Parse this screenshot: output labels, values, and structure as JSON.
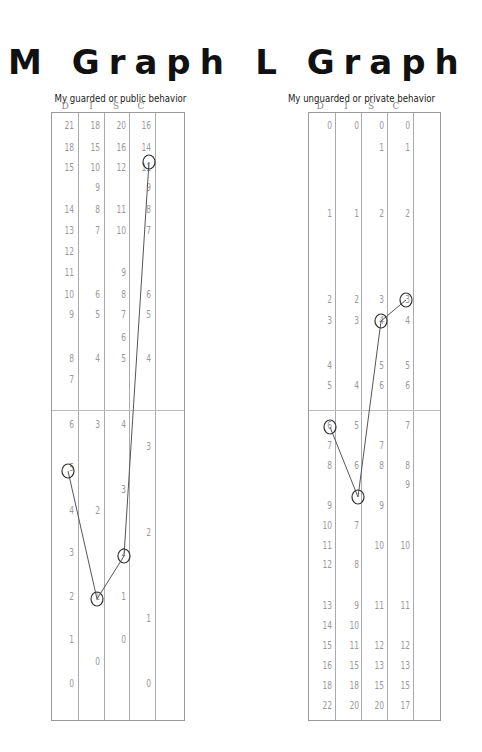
{
  "chart_data": [
    {
      "type": "line",
      "title": "M Graph",
      "subtitle": "My guarded or public behavior",
      "columns": [
        "D",
        "I",
        "S",
        "C"
      ],
      "scale_values": {
        "D": [
          21,
          18,
          15,
          14,
          13,
          12,
          11,
          10,
          9,
          8,
          7,
          6,
          5,
          4,
          3,
          2,
          1,
          0
        ],
        "I": [
          18,
          15,
          10,
          9,
          8,
          7,
          6,
          5,
          4,
          3,
          2,
          1,
          0
        ],
        "S": [
          20,
          16,
          12,
          11,
          10,
          9,
          8,
          7,
          6,
          5,
          4,
          3,
          2,
          1,
          0
        ],
        "C": [
          16,
          14,
          11,
          9,
          8,
          7,
          6,
          5,
          4,
          3,
          2,
          1,
          0
        ]
      },
      "plotted_points": {
        "D": 5,
        "I": 1,
        "S": 2,
        "C": 14
      },
      "midline": true
    },
    {
      "type": "line",
      "title": "L Graph",
      "subtitle": "My unguarded or private behavior",
      "columns": [
        "D",
        "I",
        "S",
        "C"
      ],
      "scale_values": {
        "D": [
          0,
          1,
          2,
          3,
          4,
          5,
          6,
          7,
          8,
          9,
          10,
          11,
          12,
          13,
          14,
          15,
          16,
          18,
          22
        ],
        "I": [
          0,
          1,
          2,
          3,
          4,
          5,
          6,
          7,
          8,
          9,
          10,
          11,
          15,
          18,
          20
        ],
        "S": [
          0,
          1,
          2,
          3,
          4,
          5,
          6,
          7,
          8,
          9,
          10,
          11,
          12,
          13,
          15,
          20
        ],
        "C": [
          0,
          1,
          2,
          3,
          4,
          5,
          6,
          7,
          8,
          9,
          10,
          11,
          12,
          13,
          15,
          17
        ]
      },
      "plotted_points": {
        "D": 6,
        "I": 7,
        "S": 4,
        "C": 3
      },
      "midline": true
    }
  ],
  "m": {
    "title": "M Graph",
    "subtitle": "My guarded or public behavior",
    "heads": [
      "D",
      "I",
      "S",
      "C"
    ]
  },
  "l": {
    "title": "L Graph",
    "subtitle": "My unguarded or private behavior",
    "heads": [
      "D",
      "I",
      "S",
      "C"
    ]
  },
  "m_cells": [
    {
      "c": 0,
      "y": 126,
      "t": "21"
    },
    {
      "c": 1,
      "y": 126,
      "t": "18"
    },
    {
      "c": 2,
      "y": 126,
      "t": "20"
    },
    {
      "c": 3,
      "y": 126,
      "t": "16"
    },
    {
      "c": 0,
      "y": 148,
      "t": "18"
    },
    {
      "c": 1,
      "y": 148,
      "t": "15"
    },
    {
      "c": 2,
      "y": 148,
      "t": "16"
    },
    {
      "c": 3,
      "y": 148,
      "t": "14"
    },
    {
      "c": 0,
      "y": 168,
      "t": "15"
    },
    {
      "c": 1,
      "y": 168,
      "t": "10"
    },
    {
      "c": 2,
      "y": 168,
      "t": "12"
    },
    {
      "c": 3,
      "y": 168,
      "t": "11"
    },
    {
      "c": 1,
      "y": 188,
      "t": "9"
    },
    {
      "c": 3,
      "y": 188,
      "t": "9"
    },
    {
      "c": 0,
      "y": 210,
      "t": "14"
    },
    {
      "c": 1,
      "y": 210,
      "t": "8"
    },
    {
      "c": 2,
      "y": 210,
      "t": "11"
    },
    {
      "c": 3,
      "y": 210,
      "t": "8"
    },
    {
      "c": 0,
      "y": 231,
      "t": "13"
    },
    {
      "c": 1,
      "y": 231,
      "t": "7"
    },
    {
      "c": 2,
      "y": 231,
      "t": "10"
    },
    {
      "c": 3,
      "y": 231,
      "t": "7"
    },
    {
      "c": 0,
      "y": 252,
      "t": "12"
    },
    {
      "c": 0,
      "y": 273,
      "t": "11"
    },
    {
      "c": 2,
      "y": 273,
      "t": "9"
    },
    {
      "c": 0,
      "y": 295,
      "t": "10"
    },
    {
      "c": 1,
      "y": 295,
      "t": "6"
    },
    {
      "c": 2,
      "y": 295,
      "t": "8"
    },
    {
      "c": 3,
      "y": 295,
      "t": "6"
    },
    {
      "c": 0,
      "y": 315,
      "t": "9"
    },
    {
      "c": 1,
      "y": 315,
      "t": "5"
    },
    {
      "c": 2,
      "y": 315,
      "t": "7"
    },
    {
      "c": 3,
      "y": 315,
      "t": "5"
    },
    {
      "c": 2,
      "y": 338,
      "t": "6"
    },
    {
      "c": 0,
      "y": 359,
      "t": "8"
    },
    {
      "c": 1,
      "y": 359,
      "t": "4"
    },
    {
      "c": 2,
      "y": 359,
      "t": "5"
    },
    {
      "c": 3,
      "y": 359,
      "t": "4"
    },
    {
      "c": 0,
      "y": 380,
      "t": "7"
    },
    {
      "c": 0,
      "y": 425,
      "t": "6"
    },
    {
      "c": 1,
      "y": 425,
      "t": "3"
    },
    {
      "c": 2,
      "y": 425,
      "t": "4"
    },
    {
      "c": 3,
      "y": 447,
      "t": "3"
    },
    {
      "c": 0,
      "y": 468,
      "t": "5"
    },
    {
      "c": 2,
      "y": 490,
      "t": "3"
    },
    {
      "c": 0,
      "y": 511,
      "t": "4"
    },
    {
      "c": 1,
      "y": 511,
      "t": "2"
    },
    {
      "c": 3,
      "y": 533,
      "t": "2"
    },
    {
      "c": 0,
      "y": 553,
      "t": "3"
    },
    {
      "c": 2,
      "y": 553,
      "t": "2"
    },
    {
      "c": 0,
      "y": 597,
      "t": "2"
    },
    {
      "c": 1,
      "y": 597,
      "t": "1"
    },
    {
      "c": 2,
      "y": 597,
      "t": "1"
    },
    {
      "c": 3,
      "y": 619,
      "t": "1"
    },
    {
      "c": 0,
      "y": 640,
      "t": "1"
    },
    {
      "c": 2,
      "y": 640,
      "t": "0"
    },
    {
      "c": 1,
      "y": 662,
      "t": "0"
    },
    {
      "c": 0,
      "y": 684,
      "t": "0"
    },
    {
      "c": 3,
      "y": 684,
      "t": "0"
    }
  ],
  "l_cells": [
    {
      "c": 0,
      "y": 126,
      "t": "0"
    },
    {
      "c": 1,
      "y": 126,
      "t": "0"
    },
    {
      "c": 2,
      "y": 126,
      "t": "0"
    },
    {
      "c": 3,
      "y": 126,
      "t": "0"
    },
    {
      "c": 2,
      "y": 148,
      "t": "1"
    },
    {
      "c": 3,
      "y": 148,
      "t": "1"
    },
    {
      "c": 0,
      "y": 214,
      "t": "1"
    },
    {
      "c": 1,
      "y": 214,
      "t": "1"
    },
    {
      "c": 2,
      "y": 214,
      "t": "2"
    },
    {
      "c": 3,
      "y": 214,
      "t": "2"
    },
    {
      "c": 0,
      "y": 300,
      "t": "2"
    },
    {
      "c": 1,
      "y": 300,
      "t": "2"
    },
    {
      "c": 2,
      "y": 300,
      "t": "3"
    },
    {
      "c": 3,
      "y": 300,
      "t": "3"
    },
    {
      "c": 0,
      "y": 321,
      "t": "3"
    },
    {
      "c": 1,
      "y": 321,
      "t": "3"
    },
    {
      "c": 2,
      "y": 321,
      "t": "4"
    },
    {
      "c": 3,
      "y": 321,
      "t": "4"
    },
    {
      "c": 0,
      "y": 366,
      "t": "4"
    },
    {
      "c": 2,
      "y": 366,
      "t": "5"
    },
    {
      "c": 3,
      "y": 366,
      "t": "5"
    },
    {
      "c": 0,
      "y": 386,
      "t": "5"
    },
    {
      "c": 1,
      "y": 386,
      "t": "4"
    },
    {
      "c": 2,
      "y": 386,
      "t": "6"
    },
    {
      "c": 3,
      "y": 386,
      "t": "6"
    },
    {
      "c": 0,
      "y": 426,
      "t": "6"
    },
    {
      "c": 1,
      "y": 426,
      "t": "5"
    },
    {
      "c": 3,
      "y": 426,
      "t": "7"
    },
    {
      "c": 0,
      "y": 446,
      "t": "7"
    },
    {
      "c": 2,
      "y": 446,
      "t": "7"
    },
    {
      "c": 0,
      "y": 466,
      "t": "8"
    },
    {
      "c": 1,
      "y": 466,
      "t": "6"
    },
    {
      "c": 2,
      "y": 466,
      "t": "8"
    },
    {
      "c": 3,
      "y": 466,
      "t": "8"
    },
    {
      "c": 3,
      "y": 485,
      "t": "9"
    },
    {
      "c": 0,
      "y": 506,
      "t": "9"
    },
    {
      "c": 2,
      "y": 506,
      "t": "9"
    },
    {
      "c": 0,
      "y": 526,
      "t": "10"
    },
    {
      "c": 1,
      "y": 526,
      "t": "7"
    },
    {
      "c": 0,
      "y": 546,
      "t": "11"
    },
    {
      "c": 2,
      "y": 546,
      "t": "10"
    },
    {
      "c": 3,
      "y": 546,
      "t": "10"
    },
    {
      "c": 0,
      "y": 565,
      "t": "12"
    },
    {
      "c": 1,
      "y": 565,
      "t": "8"
    },
    {
      "c": 0,
      "y": 606,
      "t": "13"
    },
    {
      "c": 1,
      "y": 606,
      "t": "9"
    },
    {
      "c": 2,
      "y": 606,
      "t": "11"
    },
    {
      "c": 3,
      "y": 606,
      "t": "11"
    },
    {
      "c": 0,
      "y": 626,
      "t": "14"
    },
    {
      "c": 1,
      "y": 626,
      "t": "10"
    },
    {
      "c": 0,
      "y": 646,
      "t": "15"
    },
    {
      "c": 1,
      "y": 646,
      "t": "11"
    },
    {
      "c": 2,
      "y": 646,
      "t": "12"
    },
    {
      "c": 3,
      "y": 646,
      "t": "12"
    },
    {
      "c": 0,
      "y": 666,
      "t": "16"
    },
    {
      "c": 1,
      "y": 666,
      "t": "15"
    },
    {
      "c": 2,
      "y": 666,
      "t": "13"
    },
    {
      "c": 3,
      "y": 666,
      "t": "13"
    },
    {
      "c": 0,
      "y": 686,
      "t": "18"
    },
    {
      "c": 1,
      "y": 686,
      "t": "18"
    },
    {
      "c": 2,
      "y": 686,
      "t": "15"
    },
    {
      "c": 3,
      "y": 686,
      "t": "15"
    },
    {
      "c": 0,
      "y": 706,
      "t": "22"
    },
    {
      "c": 1,
      "y": 706,
      "t": "20"
    },
    {
      "c": 2,
      "y": 706,
      "t": "20"
    },
    {
      "c": 3,
      "y": 706,
      "t": "17"
    }
  ],
  "m_points": [
    [
      68,
      471
    ],
    [
      97,
      599
    ],
    [
      124,
      556
    ],
    [
      149,
      162
    ]
  ],
  "l_points": [
    [
      330,
      427
    ],
    [
      358,
      497
    ],
    [
      381,
      321
    ],
    [
      406,
      300
    ]
  ],
  "ink_color": "#555555"
}
